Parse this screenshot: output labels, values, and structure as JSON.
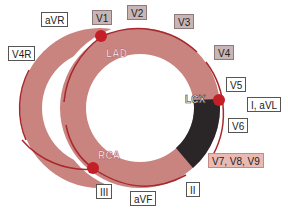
{
  "vessels": {
    "lad": "LAD",
    "lcx": "LCX",
    "rca": "RCA"
  },
  "leads": {
    "avr": "aVR",
    "v4r": "V4R",
    "v1": "V1",
    "v2": "V2",
    "v3": "V3",
    "v4": "V4",
    "v5": "V5",
    "i_avl": "I, aVL",
    "v6": "V6",
    "v7_v9": "V7, V8, V9",
    "ii": "II",
    "avf": "aVF",
    "iii": "III"
  },
  "colors": {
    "myocardium": "#c98480",
    "lcx_territory": "#2a2526",
    "arc": "#a8282c",
    "dot": "#c21f26",
    "lead_gray": "#c8b6b6",
    "lead_pink": "#e9b9b4"
  }
}
